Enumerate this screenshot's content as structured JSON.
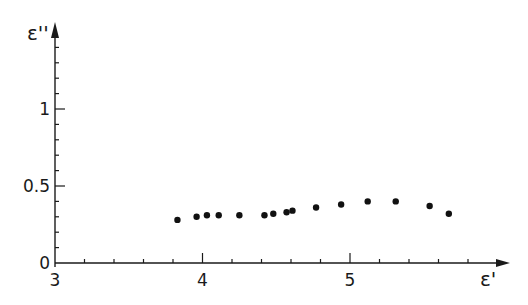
{
  "chart_data": {
    "type": "scatter",
    "title": "",
    "xlabel": "ε'",
    "ylabel": "ε''",
    "xlim": [
      3,
      6.08
    ],
    "ylim": [
      0,
      1.55
    ],
    "x_ticks_major": [
      3,
      4,
      5
    ],
    "x_tick_labels": [
      "3",
      "4",
      "5"
    ],
    "x_minor_step": 0.2,
    "y_ticks_major": [
      0,
      0.5,
      1
    ],
    "y_tick_labels": [
      "0",
      "0.5",
      "1"
    ],
    "y_minor_step": 0.1,
    "grid": false,
    "legend": null,
    "series": [
      {
        "name": "data",
        "marker": "filled-circle",
        "color": "#111111",
        "points": [
          {
            "x": 3.83,
            "y": 0.28
          },
          {
            "x": 3.96,
            "y": 0.3
          },
          {
            "x": 4.03,
            "y": 0.31
          },
          {
            "x": 4.11,
            "y": 0.31
          },
          {
            "x": 4.25,
            "y": 0.31
          },
          {
            "x": 4.42,
            "y": 0.31
          },
          {
            "x": 4.48,
            "y": 0.32
          },
          {
            "x": 4.57,
            "y": 0.33
          },
          {
            "x": 4.61,
            "y": 0.34
          },
          {
            "x": 4.77,
            "y": 0.36
          },
          {
            "x": 4.94,
            "y": 0.38
          },
          {
            "x": 5.12,
            "y": 0.4
          },
          {
            "x": 5.31,
            "y": 0.4
          },
          {
            "x": 5.54,
            "y": 0.37
          },
          {
            "x": 5.67,
            "y": 0.32
          }
        ]
      }
    ]
  },
  "colors": {
    "axis": "#1a1a1a",
    "marker": "#111111",
    "background": "#ffffff"
  }
}
